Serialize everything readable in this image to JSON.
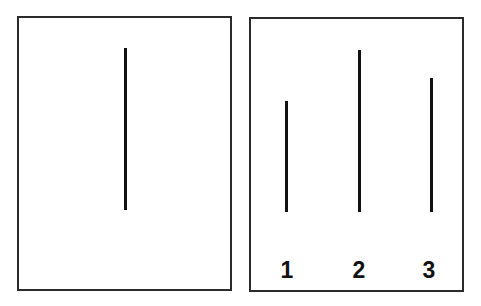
{
  "figure": {
    "reference_card": {
      "line": {
        "length_px": 162
      }
    },
    "comparison_card": {
      "lines": [
        {
          "label": "1",
          "length_px": 111
        },
        {
          "label": "2",
          "length_px": 162
        },
        {
          "label": "3",
          "length_px": 134
        }
      ]
    }
  },
  "colors": {
    "border": "#2b2b2b",
    "line": "#111111",
    "background": "#ffffff"
  }
}
